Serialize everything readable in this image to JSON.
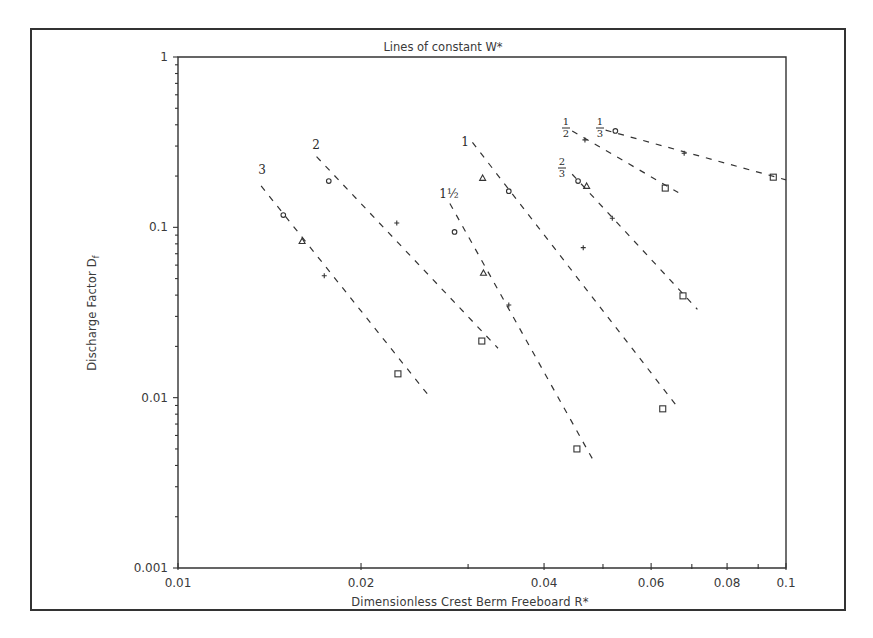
{
  "chart_data": {
    "type": "scatter",
    "title": "Lines of constant W*",
    "xlabel": "Dimensionless Crest Berm Freeboard  R*",
    "ylabel": "Discharge Factor  D",
    "ylabel_subscript": "f",
    "x_scale": "log",
    "y_scale": "log",
    "xlim": [
      0.01,
      0.1
    ],
    "ylim": [
      0.001,
      1
    ],
    "x_ticks": [
      0.01,
      0.02,
      0.04,
      0.06,
      0.08,
      0.1
    ],
    "x_tick_labels": [
      "0.01",
      "0.02",
      "0.04",
      "0.06",
      "0.08",
      "0.1"
    ],
    "y_ticks": [
      0.001,
      0.01,
      0.1,
      1
    ],
    "y_tick_labels": [
      "0.001",
      "0.01",
      "0.1",
      "1"
    ],
    "grid": false,
    "legend": null,
    "marker_types": [
      "circle",
      "triangle",
      "plus",
      "square"
    ],
    "series": [
      {
        "name": "W* = 3",
        "label": "3",
        "fit_line": [
          [
            0.0137,
            0.175
          ],
          [
            0.026,
            0.01
          ]
        ],
        "points": [
          {
            "marker": "circle",
            "x": 0.0149,
            "y": 0.118
          },
          {
            "marker": "triangle",
            "x": 0.016,
            "y": 0.083
          },
          {
            "marker": "plus",
            "x": 0.0174,
            "y": 0.052
          },
          {
            "marker": "square",
            "x": 0.023,
            "y": 0.0138
          }
        ]
      },
      {
        "name": "W* = 2",
        "label": "2",
        "fit_line": [
          [
            0.0169,
            0.26
          ],
          [
            0.0336,
            0.0195
          ]
        ],
        "points": [
          {
            "marker": "circle",
            "x": 0.0177,
            "y": 0.187
          },
          {
            "marker": "plus",
            "x": 0.0229,
            "y": 0.106
          },
          {
            "marker": "square",
            "x": 0.0316,
            "y": 0.0215
          }
        ]
      },
      {
        "name": "W* = 1.5",
        "label": "1½",
        "fit_line": [
          [
            0.028,
            0.138
          ],
          [
            0.048,
            0.0044
          ]
        ],
        "points": [
          {
            "marker": "circle",
            "x": 0.0285,
            "y": 0.094
          },
          {
            "marker": "triangle",
            "x": 0.0318,
            "y": 0.054
          },
          {
            "marker": "plus",
            "x": 0.035,
            "y": 0.035
          },
          {
            "marker": "square",
            "x": 0.0453,
            "y": 0.005
          }
        ]
      },
      {
        "name": "W* = 1",
        "label": "1",
        "fit_line": [
          [
            0.0305,
            0.315
          ],
          [
            0.0665,
            0.0087
          ]
        ],
        "points": [
          {
            "marker": "triangle",
            "x": 0.0317,
            "y": 0.195
          },
          {
            "marker": "circle",
            "x": 0.035,
            "y": 0.163
          },
          {
            "marker": "plus",
            "x": 0.0464,
            "y": 0.076
          },
          {
            "marker": "square",
            "x": 0.0627,
            "y": 0.0086
          }
        ]
      },
      {
        "name": "W* = 2/3",
        "label": "2/3",
        "fit_line": [
          [
            0.0445,
            0.205
          ],
          [
            0.0715,
            0.033
          ]
        ],
        "points": [
          {
            "marker": "circle",
            "x": 0.0455,
            "y": 0.187
          },
          {
            "marker": "triangle",
            "x": 0.047,
            "y": 0.175
          },
          {
            "marker": "plus",
            "x": 0.0518,
            "y": 0.113
          },
          {
            "marker": "square",
            "x": 0.0677,
            "y": 0.0396
          }
        ]
      },
      {
        "name": "W* = 1/2",
        "label": "1/2",
        "fit_line": [
          [
            0.0445,
            0.368
          ],
          [
            0.0665,
            0.16
          ]
        ],
        "points": [
          {
            "marker": "plus",
            "x": 0.0467,
            "y": 0.326
          },
          {
            "marker": "square",
            "x": 0.0633,
            "y": 0.17
          }
        ]
      },
      {
        "name": "W* = 1/3",
        "label": "1/3",
        "fit_line": [
          [
            0.0505,
            0.372
          ],
          [
            0.1,
            0.19
          ]
        ],
        "points": [
          {
            "marker": "circle",
            "x": 0.0524,
            "y": 0.368
          },
          {
            "marker": "plus",
            "x": 0.068,
            "y": 0.272
          },
          {
            "marker": "square",
            "x": 0.0953,
            "y": 0.197
          }
        ]
      }
    ]
  },
  "labels": {
    "title": "Lines of constant W*",
    "xlabel": "Dimensionless Crest Berm Freeboard  R*",
    "ylabel": "Discharge Factor  D",
    "ylabel_sub": "f"
  }
}
